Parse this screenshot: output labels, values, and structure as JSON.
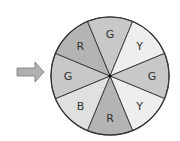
{
  "clipped_text": ":",
  "pointer": {
    "direction": "right",
    "icon": "arrow-right-icon",
    "fill": "#b0b0b0",
    "stroke": "#7a7a7a"
  },
  "spinner": {
    "center": [
      110,
      76
    ],
    "radius": 59,
    "outline": "#333333",
    "colors": {
      "R": "#b4b4b4",
      "G": "#c8c8c8",
      "B": "#e0e0e0",
      "Y": "#eeeeee"
    },
    "sectors": [
      {
        "label": "G",
        "position": "top"
      },
      {
        "label": "Y",
        "position": "upper-right"
      },
      {
        "label": "G",
        "position": "right"
      },
      {
        "label": "Y",
        "position": "lower-right"
      },
      {
        "label": "R",
        "position": "bottom"
      },
      {
        "label": "B",
        "position": "lower-left"
      },
      {
        "label": "G",
        "position": "left"
      },
      {
        "label": "R",
        "position": "upper-left"
      }
    ]
  }
}
